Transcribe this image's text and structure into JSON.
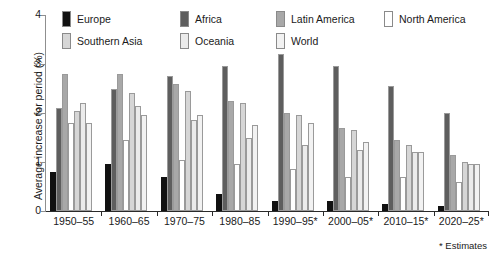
{
  "chart_data": {
    "type": "bar",
    "title": "",
    "xlabel": "",
    "ylabel": "Average increase for period (%)",
    "ylim": [
      0,
      4
    ],
    "yticks": [
      0,
      1,
      2,
      3,
      4
    ],
    "ytick_labels": [
      "0",
      "1",
      "2",
      "3",
      "4"
    ],
    "grid": false,
    "legend_position": "top",
    "footnote": "* Estimates",
    "categories": [
      "1950–55",
      "1960–65",
      "1970–75",
      "1980–85",
      "1990–95*",
      "2000–05*",
      "2010–15*",
      "2020–25*"
    ],
    "series": [
      {
        "name": "Europe",
        "color": "#111111",
        "values": [
          0.8,
          0.95,
          0.7,
          0.35,
          0.2,
          0.2,
          0.15,
          0.1
        ]
      },
      {
        "name": "Africa",
        "color": "#5e5e5e",
        "values": [
          2.1,
          2.5,
          2.75,
          2.95,
          3.2,
          2.95,
          2.55,
          2.0
        ]
      },
      {
        "name": "Latin America",
        "color": "#a8a8a8",
        "values": [
          2.8,
          2.8,
          2.6,
          2.25,
          2.0,
          1.7,
          1.45,
          1.15
        ]
      },
      {
        "name": "North America",
        "color": "#ffffff",
        "values": [
          1.8,
          1.45,
          1.05,
          0.95,
          0.85,
          0.7,
          0.7,
          0.6
        ]
      },
      {
        "name": "Southern Asia",
        "color": "#d6d6d6",
        "values": [
          2.05,
          2.4,
          2.45,
          2.2,
          1.95,
          1.65,
          1.35,
          1.0
        ]
      },
      {
        "name": "Oceania",
        "color": "#ebebeb",
        "values": [
          2.2,
          2.15,
          1.85,
          1.5,
          1.35,
          1.25,
          1.2,
          0.95
        ]
      },
      {
        "name": "World",
        "color": "#f2f2f2",
        "values": [
          1.8,
          1.95,
          1.95,
          1.75,
          1.8,
          1.4,
          1.2,
          0.95
        ]
      }
    ]
  }
}
